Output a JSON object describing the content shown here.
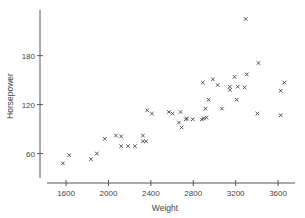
{
  "chart_data": {
    "type": "scatter",
    "title": "",
    "xlabel": "Weight",
    "ylabel": "Horsepower",
    "xlim": [
      1420,
      3760
    ],
    "ylim": [
      30,
      236
    ],
    "xticks": [
      1600,
      2000,
      2400,
      2800,
      3200,
      3600
    ],
    "yticks": [
      60,
      120,
      180
    ],
    "grid": false,
    "legend": null,
    "marker": "x",
    "series": [
      {
        "name": "cars",
        "points": [
          {
            "x": 1570,
            "y": 48
          },
          {
            "x": 1630,
            "y": 58
          },
          {
            "x": 1835,
            "y": 53
          },
          {
            "x": 1890,
            "y": 60
          },
          {
            "x": 1965,
            "y": 78
          },
          {
            "x": 2070,
            "y": 82
          },
          {
            "x": 2120,
            "y": 81
          },
          {
            "x": 2120,
            "y": 69
          },
          {
            "x": 2185,
            "y": 69
          },
          {
            "x": 2250,
            "y": 69
          },
          {
            "x": 2325,
            "y": 82
          },
          {
            "x": 2325,
            "y": 75
          },
          {
            "x": 2355,
            "y": 75
          },
          {
            "x": 2365,
            "y": 113
          },
          {
            "x": 2410,
            "y": 109
          },
          {
            "x": 2570,
            "y": 111
          },
          {
            "x": 2605,
            "y": 109
          },
          {
            "x": 2680,
            "y": 111
          },
          {
            "x": 2665,
            "y": 98
          },
          {
            "x": 2690,
            "y": 92
          },
          {
            "x": 2730,
            "y": 102
          },
          {
            "x": 2740,
            "y": 103
          },
          {
            "x": 2795,
            "y": 102
          },
          {
            "x": 2880,
            "y": 102
          },
          {
            "x": 2900,
            "y": 103
          },
          {
            "x": 2925,
            "y": 104
          },
          {
            "x": 2915,
            "y": 115
          },
          {
            "x": 2945,
            "y": 126
          },
          {
            "x": 2890,
            "y": 147
          },
          {
            "x": 2985,
            "y": 151
          },
          {
            "x": 3030,
            "y": 144
          },
          {
            "x": 3070,
            "y": 115
          },
          {
            "x": 3145,
            "y": 142
          },
          {
            "x": 3145,
            "y": 138
          },
          {
            "x": 3210,
            "y": 126
          },
          {
            "x": 3220,
            "y": 142
          },
          {
            "x": 3190,
            "y": 154
          },
          {
            "x": 3285,
            "y": 141
          },
          {
            "x": 3305,
            "y": 157
          },
          {
            "x": 3295,
            "y": 225
          },
          {
            "x": 3415,
            "y": 171
          },
          {
            "x": 3405,
            "y": 109
          },
          {
            "x": 3625,
            "y": 137
          },
          {
            "x": 3660,
            "y": 147
          },
          {
            "x": 3625,
            "y": 107
          }
        ]
      }
    ]
  },
  "labels": {
    "xlabel": "Weight",
    "ylabel": "Horsepower",
    "marker_glyph": "x"
  },
  "colors": {
    "axis": "#555555",
    "marker": "#444444",
    "text": "#444444",
    "background": "#ffffff"
  }
}
